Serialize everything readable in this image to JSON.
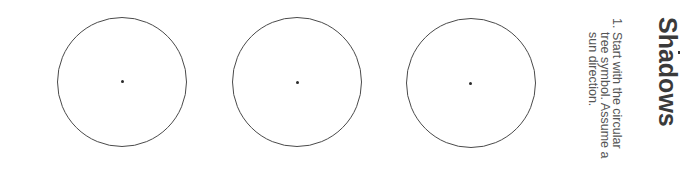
{
  "heading": "Shadows",
  "instructions": [
    {
      "number": "1.",
      "lines": [
        "Start with the circular",
        "tree symbol. Assume a",
        "sun direction."
      ]
    }
  ],
  "figures": [
    {
      "label": "circular-tree-symbol-1",
      "shape": "circle-with-center-dot"
    },
    {
      "label": "circular-tree-symbol-2",
      "shape": "circle-with-center-dot"
    },
    {
      "label": "circular-tree-symbol-3",
      "shape": "circle-with-center-dot"
    }
  ],
  "colors": {
    "outline": "#4a4a4a",
    "heading": "#3a3a3a",
    "body_text": "#555555",
    "background": "#ffffff"
  }
}
